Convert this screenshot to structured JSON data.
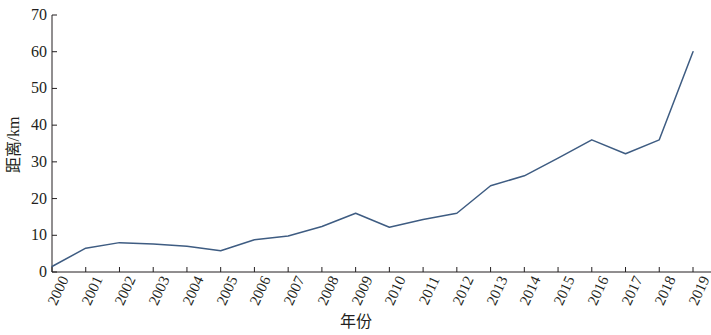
{
  "chart_data": {
    "type": "line",
    "title": "",
    "subtitle": "",
    "xlabel": "年份",
    "ylabel": "距离/km",
    "categories": [
      "2000",
      "2001",
      "2002",
      "2003",
      "2004",
      "2005",
      "2006",
      "2007",
      "2008",
      "2009",
      "2010",
      "2011",
      "2012",
      "2013",
      "2014",
      "2015",
      "2016",
      "2017",
      "2018",
      "2019"
    ],
    "values": [
      1.5,
      6.5,
      8.0,
      7.6,
      7.0,
      5.8,
      8.8,
      9.8,
      12.4,
      16.0,
      12.2,
      14.3,
      16.0,
      23.5,
      26.2,
      31.0,
      36.0,
      32.2,
      36.0,
      60.0
    ],
    "series": [
      {
        "name": "距离",
        "values": [
          1.5,
          6.5,
          8.0,
          7.6,
          7.0,
          5.8,
          8.8,
          9.8,
          12.4,
          16.0,
          12.2,
          14.3,
          16.0,
          23.5,
          26.2,
          31.0,
          36.0,
          32.2,
          36.0,
          60.0
        ]
      }
    ],
    "ylim": [
      0,
      70
    ],
    "yticks": [
      0,
      10,
      20,
      30,
      40,
      50,
      60,
      70
    ],
    "ytick_labels": [
      "0",
      "10",
      "20",
      "30",
      "40",
      "50",
      "60",
      "70"
    ],
    "xtick_labels": [
      "2000",
      "2001",
      "2002",
      "2003",
      "2004",
      "2005",
      "2006",
      "2007",
      "2008",
      "2009",
      "2010",
      "2011",
      "2012",
      "2013",
      "2014",
      "2015",
      "2016",
      "2017",
      "2018",
      "2019"
    ],
    "grid": false,
    "legend": false,
    "legend_position": "none",
    "line_color": "#3e5c82",
    "axis_color": "#231f20",
    "background_color": "#ffffff",
    "markers": false
  }
}
